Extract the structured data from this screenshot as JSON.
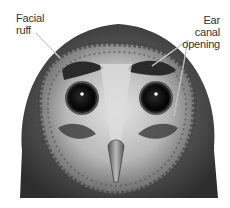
{
  "diagram": {
    "labels": [
      {
        "id": "facial-ruff",
        "lines": [
          "Facial",
          "ruff"
        ]
      },
      {
        "id": "ear-canal-opening",
        "lines": [
          "Ear canal",
          "opening"
        ]
      }
    ],
    "colors": {
      "background": "#ffffff",
      "text": "#333333",
      "leader_line": "#ffffff",
      "feather_dark": "#3a3a3a",
      "feather_mid": "#7a7a7a",
      "face_light": "#d8d8d8",
      "eye": "#0a0a0a"
    }
  }
}
